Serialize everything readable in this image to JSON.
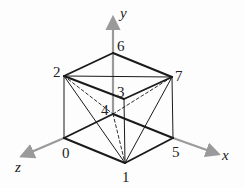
{
  "diagram": {
    "type": "cube-with-diagonals",
    "axes": [
      {
        "name": "y",
        "label": "y",
        "from": [
          113,
          114
        ],
        "to": [
          113,
          18
        ],
        "label_pos": [
          120,
          18
        ]
      },
      {
        "name": "x",
        "label": "x",
        "from": [
          173,
          138
        ],
        "to": [
          218,
          154
        ],
        "label_pos": [
          222,
          160
        ]
      },
      {
        "name": "z",
        "label": "z",
        "from": [
          64,
          138
        ],
        "to": [
          22,
          156
        ],
        "label_pos": [
          15,
          172
        ]
      }
    ],
    "vertices": [
      {
        "id": "0",
        "label": "0",
        "x": 64,
        "y": 138,
        "label_pos": [
          62,
          158
        ]
      },
      {
        "id": "1",
        "label": "1",
        "x": 125,
        "y": 163,
        "label_pos": [
          122,
          182
        ]
      },
      {
        "id": "2",
        "label": "2",
        "x": 64,
        "y": 76,
        "label_pos": [
          53,
          77
        ]
      },
      {
        "id": "3",
        "label": "3",
        "x": 124,
        "y": 99,
        "label_pos": [
          117,
          97
        ]
      },
      {
        "id": "4",
        "label": "4",
        "x": 113,
        "y": 114,
        "label_pos": [
          101,
          115
        ]
      },
      {
        "id": "5",
        "label": "5",
        "x": 173,
        "y": 138,
        "label_pos": [
          172,
          157
        ]
      },
      {
        "id": "6",
        "label": "6",
        "x": 113,
        "y": 53,
        "label_pos": [
          117,
          51
        ]
      },
      {
        "id": "7",
        "label": "7",
        "x": 172,
        "y": 77,
        "label_pos": [
          175,
          81
        ]
      }
    ],
    "edges_bold": [
      [
        "0",
        "1"
      ],
      [
        "1",
        "5"
      ],
      [
        "0",
        "4"
      ],
      [
        "4",
        "5"
      ],
      [
        "2",
        "3"
      ],
      [
        "3",
        "7"
      ],
      [
        "2",
        "6"
      ],
      [
        "6",
        "7"
      ]
    ],
    "edges_thin": [
      [
        "0",
        "2"
      ],
      [
        "1",
        "3"
      ],
      [
        "5",
        "7"
      ],
      [
        "2",
        "7"
      ],
      [
        "2",
        "1"
      ],
      [
        "1",
        "7"
      ]
    ],
    "edges_dashed": [
      [
        "2",
        "4"
      ],
      [
        "4",
        "7"
      ],
      [
        "4",
        "1"
      ]
    ],
    "colors": {
      "edge": "#1a1a1a",
      "axis": "#9a9a9a",
      "label": "#222222"
    }
  }
}
